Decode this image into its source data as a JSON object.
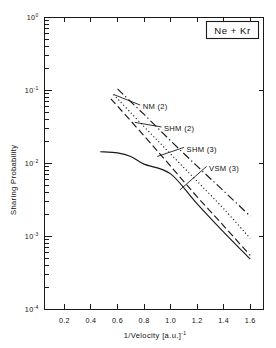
{
  "chart_data": {
    "type": "line",
    "title": "",
    "annotation": "Ne + Kr",
    "xlabel": "1/Velocity  [a.u.]",
    "xlabel_sup": "-1",
    "ylabel": "Sharing Probability",
    "xlim": [
      0.05,
      1.7
    ],
    "ylim_log": [
      -4,
      0
    ],
    "xticks": [
      0.2,
      0.4,
      0.6,
      0.8,
      1.0,
      1.2,
      1.4,
      1.6
    ],
    "xticklabels": [
      "0.2",
      "0.4",
      "0.6",
      "0.8",
      "1.0",
      "1.2",
      "1.4",
      "1.6"
    ],
    "yticks_major_exp": [
      0,
      -1,
      -2,
      -3,
      -4
    ],
    "yticklabels": [
      "10",
      "10",
      "10",
      "10",
      "10"
    ],
    "yticklabel_exps": [
      "0",
      "-1",
      "-2",
      "-3",
      "-4"
    ],
    "grid": false,
    "legend_position": "inline-labels",
    "series": [
      {
        "name": "NM (2)",
        "style": "dash-dot",
        "label_text": "NM (2)",
        "x": [
          0.6,
          0.8,
          1.0,
          1.2,
          1.4,
          1.6
        ],
        "y": [
          0.105,
          0.047,
          0.0205,
          0.0092,
          0.0042,
          0.0019
        ]
      },
      {
        "name": "SHM (2)",
        "style": "dotted",
        "label_text": "SHM (2)",
        "x": [
          0.57,
          0.8,
          1.0,
          1.2,
          1.4,
          1.6
        ],
        "y": [
          0.088,
          0.032,
          0.0135,
          0.0057,
          0.0024,
          0.00094
        ]
      },
      {
        "name": "SHM (3)",
        "style": "dashed",
        "label_text": "SHM (3)",
        "x": [
          0.55,
          0.8,
          1.0,
          1.2,
          1.4,
          1.6
        ],
        "y": [
          0.077,
          0.024,
          0.0092,
          0.0035,
          0.0014,
          0.00055
        ]
      },
      {
        "name": "VSM (3)",
        "style": "solid",
        "label_text": "VSM (3)",
        "x": [
          0.47,
          0.6,
          0.7,
          0.8,
          1.0,
          1.2,
          1.4,
          1.6
        ],
        "y": [
          0.0145,
          0.014,
          0.0125,
          0.0098,
          0.0072,
          0.0028,
          0.00115,
          0.00049
        ]
      }
    ],
    "curve_labels": [
      {
        "text": "NM (2)",
        "x": 0.79,
        "y_exp": -1.22
      },
      {
        "text": "SHM (2)",
        "x": 0.95,
        "y_exp": -1.52
      },
      {
        "text": "SHM (3)",
        "x": 1.12,
        "y_exp": -1.8
      },
      {
        "text": "VSM (3)",
        "x": 1.29,
        "y_exp": -2.06
      }
    ]
  },
  "axes": {
    "x_title_main": "1/Velocity  [a.u.]",
    "x_title_exp": "-1",
    "y_title": "Sharing Probability"
  },
  "legend": {
    "system_label": "Ne + Kr"
  },
  "colors": {
    "ink": "#1a1a1a",
    "background": "#ffffff"
  }
}
